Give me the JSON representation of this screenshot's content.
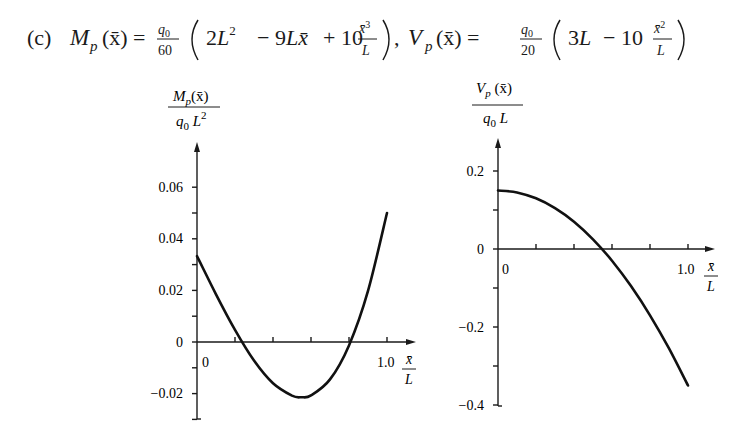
{
  "formula": {
    "part_label": "(c)",
    "moment": {
      "lhs_symbol": "M",
      "lhs_subscript": "p",
      "lhs_arg": "(x̄)",
      "equals": "=",
      "coef_num": "q0",
      "coef_den": "60",
      "terms": [
        "2L²",
        "− 9Lx̄",
        "+ 10",
        "x̄³",
        "L"
      ]
    },
    "separator": ",",
    "shear": {
      "lhs_symbol": "V",
      "lhs_subscript": "p",
      "lhs_arg": "(x̄)",
      "equals": "=",
      "coef_num": "q0",
      "coef_den": "20",
      "terms": [
        "3L",
        "− 10",
        "x̄²",
        "L"
      ]
    }
  },
  "chart_data": [
    {
      "type": "line",
      "title": "",
      "ylabel": "M_p(x̄) / (q0 L²)",
      "ylabel_num": "Mp(x̄)",
      "ylabel_den": "q0 L²",
      "xlabel": "x̄/L",
      "xlabel_num": "x̄",
      "xlabel_den": "L",
      "xlim": [
        0,
        1.0
      ],
      "ylim": [
        -0.03,
        0.07
      ],
      "x_tick_labels": [
        "0",
        "1.0"
      ],
      "x_ticks": [
        0,
        0.2,
        0.4,
        0.6,
        0.8,
        1.0
      ],
      "y_tick_labels": [
        "0.06",
        "0.04",
        "0.02",
        "0",
        "−0.02"
      ],
      "y_ticks": [
        0.06,
        0.05,
        0.04,
        0.03,
        0.02,
        0.01,
        0,
        -0.01,
        -0.02,
        -0.03
      ],
      "grid": false,
      "series": [
        {
          "name": "M_p/(q0 L²) = (2 − 9x̄/L + 10(x̄/L)³)/60",
          "x": [
            0,
            0.1,
            0.2,
            0.3,
            0.4,
            0.5,
            0.55,
            0.6,
            0.7,
            0.8,
            0.9,
            1.0
          ],
          "y": [
            0.0333,
            0.0185,
            0.0047,
            -0.0072,
            -0.016,
            -0.0208,
            -0.0214,
            -0.0207,
            -0.0145,
            -0.0013,
            0.0198,
            0.05
          ]
        }
      ]
    },
    {
      "type": "line",
      "title": "",
      "ylabel": "V_p(x̄) / (q0 L)",
      "ylabel_num": "Vp(x̄)",
      "ylabel_den": "q0 L",
      "xlabel": "x̄/L",
      "xlabel_num": "x̄",
      "xlabel_den": "L",
      "xlim": [
        0,
        1.0
      ],
      "ylim": [
        -0.4,
        0.25
      ],
      "x_tick_labels": [
        "0",
        "1.0"
      ],
      "x_ticks": [
        0,
        0.2,
        0.4,
        0.6,
        0.8,
        1.0
      ],
      "y_tick_labels": [
        "0.2",
        "0",
        "−0.2",
        "−0.4"
      ],
      "y_ticks": [
        0.2,
        0.1,
        0,
        -0.1,
        -0.2,
        -0.3,
        -0.4
      ],
      "grid": false,
      "series": [
        {
          "name": "V_p/(q0 L) = (3 − 10(x̄/L)²)/20",
          "x": [
            0,
            0.1,
            0.2,
            0.3,
            0.4,
            0.5,
            0.6,
            0.7,
            0.8,
            0.9,
            1.0
          ],
          "y": [
            0.15,
            0.145,
            0.13,
            0.105,
            0.07,
            0.025,
            -0.03,
            -0.095,
            -0.17,
            -0.255,
            -0.35
          ]
        }
      ]
    }
  ]
}
